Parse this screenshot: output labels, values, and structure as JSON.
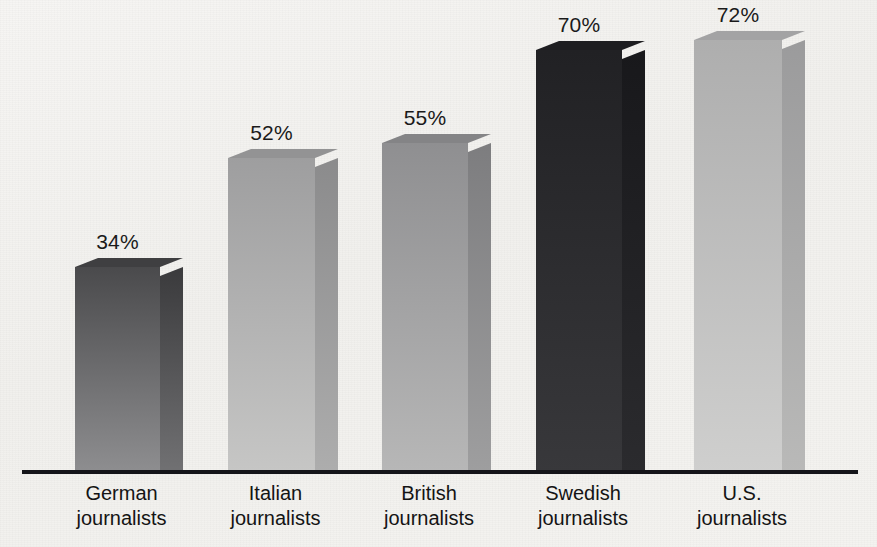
{
  "chart_data": {
    "type": "bar",
    "title": "",
    "subtitle": "",
    "xlabel": "",
    "ylabel": "",
    "ylim": [
      0,
      100
    ],
    "grid": false,
    "legend": "none",
    "value_suffix": "%",
    "categories": [
      "German journalists",
      "Italian journalists",
      "British journalists",
      "Swedish journalists",
      "U.S. journalists"
    ],
    "category_lines": [
      {
        "line1": "German",
        "line2": "journalists"
      },
      {
        "line1": "Italian",
        "line2": "journalists"
      },
      {
        "line1": "British",
        "line2": "journalists"
      },
      {
        "line1": "Swedish",
        "line2": "journalists"
      },
      {
        "line1": "U.S.",
        "line2": "journalists"
      }
    ],
    "values": [
      34,
      52,
      55,
      70,
      72
    ],
    "data_labels": [
      "34%",
      "52%",
      "55%",
      "70%",
      "72%"
    ]
  },
  "bars": [
    {
      "name": "german",
      "label": "34%",
      "value": 34,
      "left_px": 75,
      "width_px": 85,
      "height_px": 205,
      "face_top_color": "#4a4a4c",
      "face_bottom_color": "#8e8e90",
      "side_top_color": "#3a3a3c",
      "side_bottom_color": "#717173",
      "top_color": "#3f3f41"
    },
    {
      "name": "italian",
      "label": "52%",
      "value": 52,
      "left_px": 228,
      "width_px": 87,
      "height_px": 314,
      "face_top_color": "#9e9e9f",
      "face_bottom_color": "#c6c6c5",
      "side_top_color": "#8b8b8c",
      "side_bottom_color": "#adadad",
      "top_color": "#939394"
    },
    {
      "name": "british",
      "label": "55%",
      "value": 55,
      "left_px": 382,
      "width_px": 86,
      "height_px": 329,
      "face_top_color": "#8f8f91",
      "face_bottom_color": "#b7b7b7",
      "side_top_color": "#7d7d7f",
      "side_bottom_color": "#9e9e9f",
      "top_color": "#848486"
    },
    {
      "name": "swedish",
      "label": "70%",
      "value": 70,
      "left_px": 536,
      "width_px": 86,
      "height_px": 422,
      "face_top_color": "#212124",
      "face_bottom_color": "#38383b",
      "side_top_color": "#18181b",
      "side_bottom_color": "#2b2b2e",
      "top_color": "#1d1d20"
    },
    {
      "name": "us",
      "label": "72%",
      "value": 72,
      "left_px": 694,
      "width_px": 88,
      "height_px": 432,
      "face_top_color": "#aeaeae",
      "face_bottom_color": "#cfcfce",
      "side_top_color": "#9b9b9c",
      "side_bottom_color": "#b9b9b8",
      "top_color": "#a3a3a4"
    }
  ],
  "axis": {
    "line_color": "#15151a"
  }
}
